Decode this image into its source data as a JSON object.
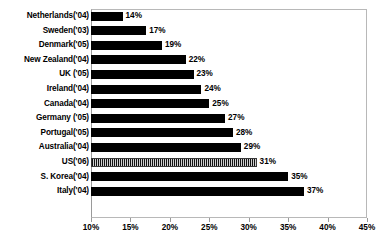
{
  "chart_data": {
    "type": "bar",
    "orientation": "horizontal",
    "title": "",
    "xlabel": "",
    "ylabel": "",
    "xlim": [
      10,
      45
    ],
    "xticks": [
      "10%",
      "15%",
      "20%",
      "25%",
      "30%",
      "35%",
      "40%",
      "45%"
    ],
    "xtick_values": [
      10,
      15,
      20,
      25,
      30,
      35,
      40,
      45
    ],
    "grid": false,
    "legend": null,
    "baseline": 10,
    "categories": [
      "Netherlands('04)",
      "Sweden('03)",
      "Denmark('05)",
      "New Zealand('04)",
      "UK ('05)",
      "Ireland('04)",
      "Canada('04)",
      "Germany ('05)",
      "Portugal('05)",
      "Australia('04)",
      "US('06)",
      "S. Korea('04)",
      "Italy('04)"
    ],
    "values": [
      14,
      17,
      19,
      22,
      23,
      24,
      25,
      27,
      28,
      29,
      31,
      35,
      37
    ],
    "data_labels": [
      "14%",
      "17%",
      "19%",
      "22%",
      "23%",
      "24%",
      "25%",
      "27%",
      "28%",
      "29%",
      "31%",
      "35%",
      "37%"
    ],
    "bar_styles": [
      "solid",
      "solid",
      "solid",
      "solid",
      "solid",
      "solid",
      "solid",
      "solid",
      "solid",
      "solid",
      "patterned",
      "solid",
      "solid"
    ],
    "colors": {
      "bar_solid": "#000000",
      "bar_patterned": "#555555",
      "frame": "#b8b8b8",
      "text": "#000000",
      "background": "#ffffff"
    }
  }
}
